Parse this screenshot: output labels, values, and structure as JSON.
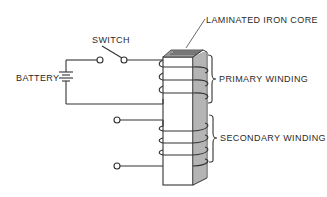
{
  "diagram": {
    "labels": {
      "core": "LAMINATED IRON CORE",
      "switch": "SWITCH",
      "battery": "BATTERY",
      "primary": "PRIMARY WINDING",
      "secondary": "SECONDARY WINDING"
    },
    "components": [
      {
        "name": "battery",
        "type": "battery-symbol"
      },
      {
        "name": "switch",
        "type": "open-switch"
      },
      {
        "name": "laminated-iron-core",
        "type": "core"
      },
      {
        "name": "primary-winding",
        "turns": 3
      },
      {
        "name": "secondary-winding",
        "turns": 4,
        "terminals": 2
      }
    ],
    "colors": {
      "line": "#333333",
      "background": "#ffffff"
    }
  }
}
